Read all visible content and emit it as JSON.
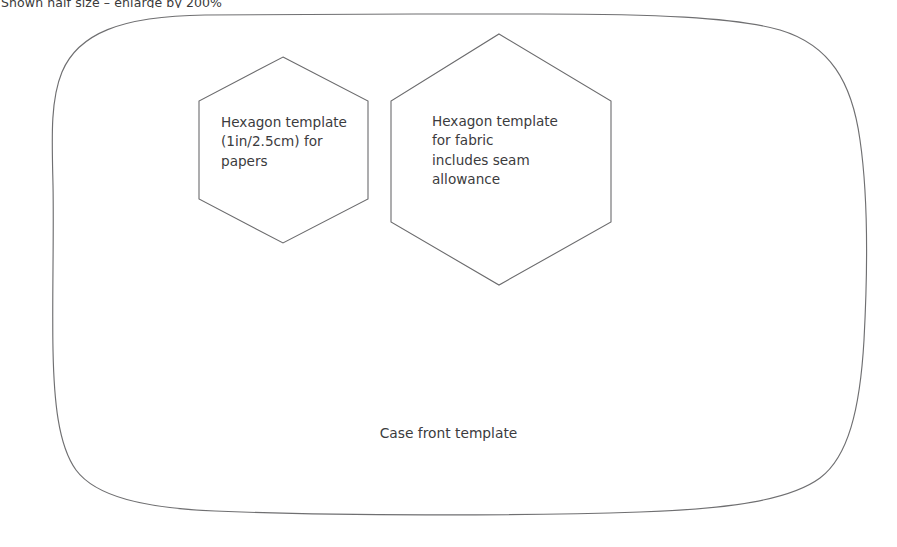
{
  "page": {
    "background_color": "#ffffff",
    "stroke_color": "#6f6f71",
    "text_color": "#3b3b3d",
    "width": 897,
    "height": 547
  },
  "caption": {
    "text": "Shown half size – enlarge by 200%",
    "clipped": "true"
  },
  "templates": {
    "case_front": {
      "name": "case-front-template",
      "label": "Case front template",
      "shape": "rounded-rectangle"
    },
    "hexagon_papers": {
      "name": "hexagon-template-papers",
      "label": "Hexagon template\n(1in/2.5cm) for\npapers",
      "shape": "hexagon",
      "size": "1in/2.5cm"
    },
    "hexagon_fabric": {
      "name": "hexagon-template-fabric",
      "label": "Hexagon template\nfor fabric\nincludes seam\nallowance",
      "shape": "hexagon"
    }
  }
}
